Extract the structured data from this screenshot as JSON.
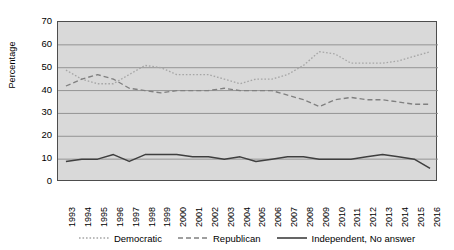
{
  "chart_data": {
    "type": "line",
    "title": "",
    "xlabel": "",
    "ylabel": "Percentage",
    "ylim": [
      0,
      70
    ],
    "ytick_step": 10,
    "yticks": [
      70,
      60,
      50,
      40,
      30,
      20,
      10,
      0
    ],
    "grid": true,
    "grid_axis": "y",
    "legend_position": "bottom",
    "plot_background": "#d9d9d9",
    "categories": [
      "1993",
      "1994",
      "1995",
      "1996",
      "1997",
      "1998",
      "1999",
      "2000",
      "2001",
      "2002",
      "2003",
      "2004",
      "2005",
      "2006",
      "2007",
      "2008",
      "2009",
      "2010",
      "2011",
      "2012",
      "2013",
      "2014",
      "2015",
      "2016"
    ],
    "series": [
      {
        "name": "Democratic",
        "style": "dotted",
        "color": "#a6a6a6",
        "values": [
          49,
          45,
          43,
          43,
          47,
          51,
          50,
          47,
          47,
          47,
          45,
          43,
          45,
          45,
          47,
          51,
          57,
          56,
          52,
          52,
          52,
          53,
          55,
          57
        ]
      },
      {
        "name": "Republican",
        "style": "dashed",
        "color": "#808080",
        "values": [
          42,
          45,
          47,
          45,
          41,
          40,
          39,
          40,
          40,
          40,
          41,
          40,
          40,
          40,
          38,
          36,
          33,
          36,
          37,
          36,
          36,
          35,
          34,
          34
        ]
      },
      {
        "name": "Independent, No answer",
        "style": "solid",
        "color": "#3f3f3f",
        "values": [
          9,
          10,
          10,
          12,
          9,
          12,
          12,
          12,
          11,
          11,
          10,
          11,
          9,
          10,
          11,
          11,
          10,
          10,
          10,
          11,
          12,
          11,
          10,
          6
        ]
      }
    ]
  },
  "legend": {
    "items": [
      {
        "label": "Democratic"
      },
      {
        "label": "Republican"
      },
      {
        "label": "Independent, No answer"
      }
    ]
  }
}
